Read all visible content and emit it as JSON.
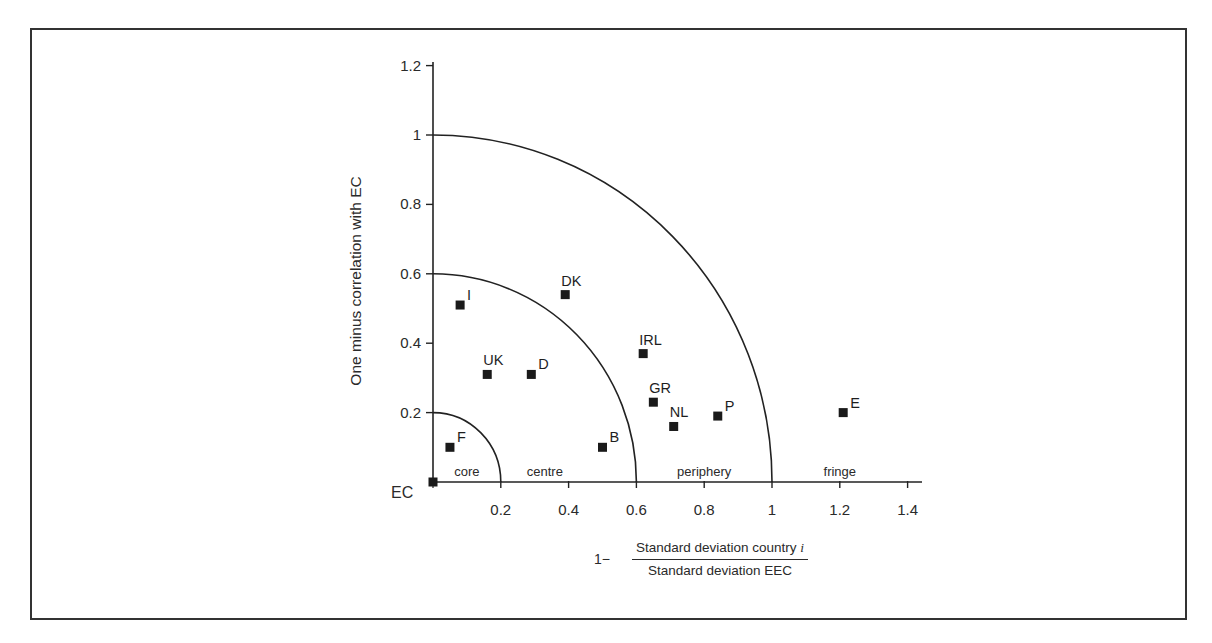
{
  "chart_data": {
    "type": "scatter",
    "title": "",
    "xlabel": {
      "prefix": "1−",
      "numerator": "Standard deviation country ",
      "numerator_italic": "i",
      "denominator": "Standard deviation EEC"
    },
    "ylabel": "One minus correlation with EC",
    "origin_label": "EC",
    "xlim": [
      0,
      1.4
    ],
    "ylim": [
      0,
      1.2
    ],
    "x_ticks": [
      0.2,
      0.4,
      0.6,
      0.8,
      1,
      1.2,
      1.4
    ],
    "x_tick_labels": [
      "0.2",
      "0.4",
      "0.6",
      "0.8",
      "1",
      "1.2",
      "1.4"
    ],
    "y_ticks": [
      0.2,
      0.4,
      0.6,
      0.8,
      1,
      1.2
    ],
    "y_tick_labels": [
      "0.2",
      "0.4",
      "0.6",
      "0.8",
      "1",
      "1.2"
    ],
    "grid": false,
    "legend": null,
    "circle_boundaries": [
      0.2,
      0.6,
      1.0
    ],
    "regions": [
      {
        "label": "core",
        "x": 0.1
      },
      {
        "label": "centre",
        "x": 0.33
      },
      {
        "label": "periphery",
        "x": 0.8
      },
      {
        "label": "fringe",
        "x": 1.2
      }
    ],
    "points": [
      {
        "label": "EC",
        "x": 0.0,
        "y": 0.0,
        "show_label": false
      },
      {
        "label": "F",
        "x": 0.05,
        "y": 0.1,
        "show_label": true
      },
      {
        "label": "I",
        "x": 0.08,
        "y": 0.51,
        "show_label": true
      },
      {
        "label": "UK",
        "x": 0.16,
        "y": 0.31,
        "show_label": true
      },
      {
        "label": "D",
        "x": 0.29,
        "y": 0.31,
        "show_label": true
      },
      {
        "label": "DK",
        "x": 0.39,
        "y": 0.54,
        "show_label": true
      },
      {
        "label": "B",
        "x": 0.5,
        "y": 0.1,
        "show_label": true
      },
      {
        "label": "IRL",
        "x": 0.62,
        "y": 0.37,
        "show_label": true
      },
      {
        "label": "GR",
        "x": 0.65,
        "y": 0.23,
        "show_label": true
      },
      {
        "label": "NL",
        "x": 0.71,
        "y": 0.16,
        "show_label": true
      },
      {
        "label": "P",
        "x": 0.84,
        "y": 0.19,
        "show_label": true
      },
      {
        "label": "E",
        "x": 1.21,
        "y": 0.2,
        "show_label": true
      }
    ]
  }
}
